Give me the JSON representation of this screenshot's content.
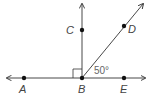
{
  "diagram": {
    "points": {
      "A": {
        "label": "A"
      },
      "B": {
        "label": "B"
      },
      "C": {
        "label": "C"
      },
      "D": {
        "label": "D"
      },
      "E": {
        "label": "E"
      }
    },
    "angle_label": "50°",
    "right_angle_marker": true,
    "colors": {
      "line": "#333333",
      "text": "#444444"
    }
  }
}
